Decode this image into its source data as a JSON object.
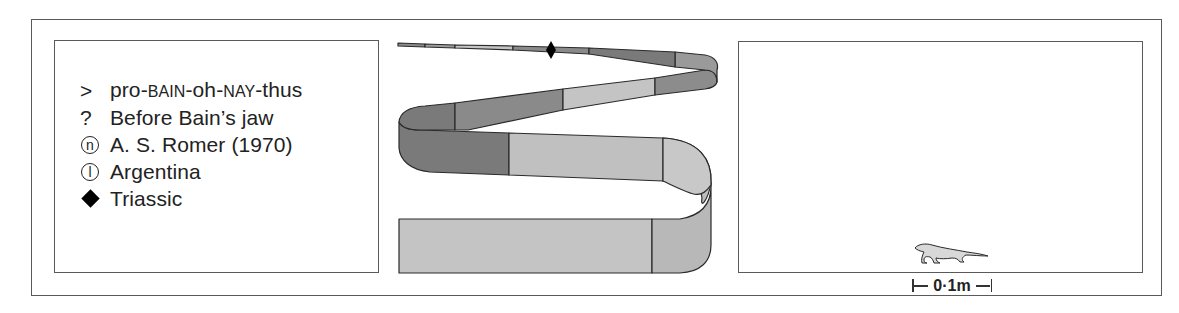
{
  "legend": {
    "items": [
      {
        "symbol": "greater-than",
        "glyph": ">",
        "label_parts": [
          "pro-",
          "BAIN",
          "-oh-",
          "NAY",
          "-thus"
        ],
        "meaning": "pronunciation"
      },
      {
        "symbol": "question-mark",
        "glyph": "?",
        "label": "Before Bain’s jaw",
        "meaning": "name meaning"
      },
      {
        "symbol": "circled-n",
        "glyph": "n",
        "label": "A. S. Romer (1970)",
        "meaning": "named by"
      },
      {
        "symbol": "circled-l",
        "glyph": "l",
        "label": "Argentina",
        "meaning": "location"
      },
      {
        "symbol": "diamond",
        "glyph": "◆",
        "label": "Triassic",
        "meaning": "period"
      }
    ]
  },
  "timeline_ribbon": {
    "marker": "diamond",
    "colors": {
      "dark": "#7a7a7a",
      "mid": "#9a9a9a",
      "light": "#c4c4c4",
      "outline": "#2a2a2a"
    }
  },
  "scale": {
    "label": "0·1m",
    "silhouette": "probainognathus-silhouette"
  }
}
